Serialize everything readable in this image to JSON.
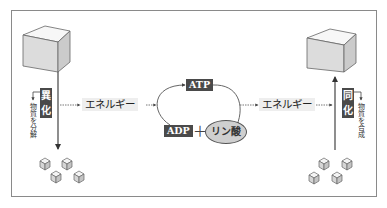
{
  "diagram": {
    "catabolism": {
      "label": "異化",
      "label_chars": [
        "異",
        "化"
      ],
      "note": "物質を分解",
      "direction": "down"
    },
    "anabolism": {
      "label": "同化",
      "label_chars": [
        "同",
        "化"
      ],
      "note": "物質を合成",
      "direction": "up"
    },
    "energy_left": "エネルギー",
    "energy_right": "エネルギー",
    "cycle": {
      "top": "ATP",
      "bottom_left": "ADP",
      "plus": "＋",
      "bottom_right": "リン酸"
    },
    "small_cubes_left": 4,
    "small_cubes_right": 4
  },
  "colors": {
    "label_bg": "#4a4a4a",
    "ellipse_fill": "#cfcfcf",
    "energy_bg": "#eeeeee",
    "border": "#8a8a8a"
  }
}
